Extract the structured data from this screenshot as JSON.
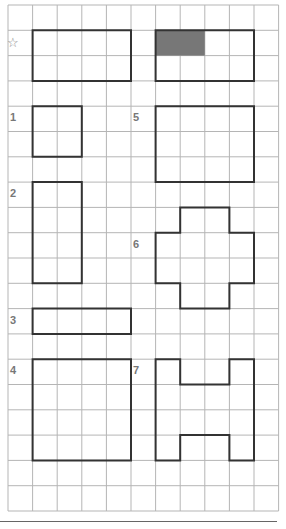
{
  "worksheet": {
    "grid": {
      "columns": 11,
      "rows": 20,
      "origin_x": 8,
      "origin_y": 5,
      "cell_w": 24.6,
      "cell_h": 25.3,
      "line_color": "#b5b5b5",
      "outline_color": "#333333",
      "shade_color": "#777777"
    },
    "example": {
      "marker": "☆",
      "left_shape": {
        "x": 1,
        "y": 1,
        "w": 4,
        "h": 2
      },
      "right_shape": {
        "x": 6,
        "y": 1,
        "w": 4,
        "h": 2,
        "shaded": {
          "x": 6,
          "y": 1,
          "w": 2,
          "h": 1
        }
      }
    },
    "shapes": [
      {
        "label": "1",
        "label_col": 0,
        "label_row": 4,
        "points": [
          [
            1,
            4
          ],
          [
            3,
            4
          ],
          [
            3,
            6
          ],
          [
            1,
            6
          ]
        ]
      },
      {
        "label": "2",
        "label_col": 0,
        "label_row": 7,
        "points": [
          [
            1,
            7
          ],
          [
            3,
            7
          ],
          [
            3,
            11
          ],
          [
            1,
            11
          ]
        ]
      },
      {
        "label": "3",
        "label_col": 0,
        "label_row": 12,
        "points": [
          [
            1,
            12
          ],
          [
            5,
            12
          ],
          [
            5,
            13
          ],
          [
            1,
            13
          ]
        ]
      },
      {
        "label": "4",
        "label_col": 0,
        "label_row": 14,
        "points": [
          [
            1,
            14
          ],
          [
            5,
            14
          ],
          [
            5,
            18
          ],
          [
            1,
            18
          ]
        ]
      },
      {
        "label": "5",
        "label_col": 5,
        "label_row": 4,
        "points": [
          [
            6,
            4
          ],
          [
            10,
            4
          ],
          [
            10,
            7
          ],
          [
            6,
            7
          ]
        ]
      },
      {
        "label": "6",
        "label_col": 5,
        "label_row": 9,
        "points": [
          [
            7,
            8
          ],
          [
            9,
            8
          ],
          [
            9,
            9
          ],
          [
            10,
            9
          ],
          [
            10,
            11
          ],
          [
            9,
            11
          ],
          [
            9,
            12
          ],
          [
            7,
            12
          ],
          [
            7,
            11
          ],
          [
            6,
            11
          ],
          [
            6,
            9
          ],
          [
            7,
            9
          ]
        ]
      },
      {
        "label": "7",
        "label_col": 5,
        "label_row": 14,
        "points": [
          [
            6,
            14
          ],
          [
            7,
            14
          ],
          [
            7,
            15
          ],
          [
            9,
            15
          ],
          [
            9,
            14
          ],
          [
            10,
            14
          ],
          [
            10,
            18
          ],
          [
            9,
            18
          ],
          [
            9,
            17
          ],
          [
            7,
            17
          ],
          [
            7,
            18
          ],
          [
            6,
            18
          ]
        ]
      }
    ]
  }
}
